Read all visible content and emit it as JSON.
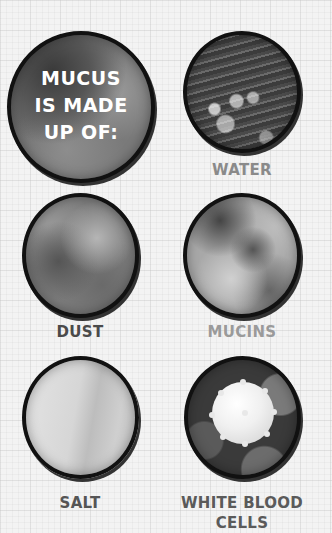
{
  "title": {
    "lines": [
      "MUCUS",
      "IS MADE",
      "UP OF:"
    ]
  },
  "items": [
    {
      "label": "WATER",
      "color": "#8a8a8a"
    },
    {
      "label": "DUST",
      "color": "#4a4a4a"
    },
    {
      "label": "MUCINS",
      "color": "#9a9a9a"
    },
    {
      "label": "SALT",
      "color": "#555555"
    },
    {
      "label": "WHITE BLOOD",
      "label2": "CELLS",
      "color": "#5a5a5a"
    }
  ]
}
